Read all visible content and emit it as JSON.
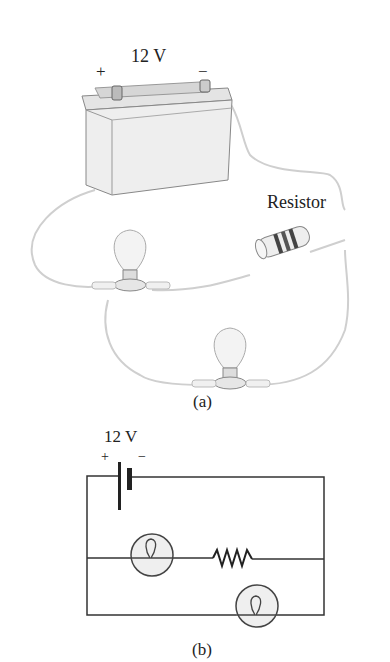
{
  "figure_a": {
    "caption": "(a)",
    "battery": {
      "voltage_label": "12 V",
      "plus_label": "+",
      "minus_label": "−"
    },
    "resistor_label": "Resistor"
  },
  "figure_b": {
    "caption": "(b)",
    "battery": {
      "voltage_label": "12 V",
      "plus_label": "+",
      "minus_label": "−"
    }
  }
}
